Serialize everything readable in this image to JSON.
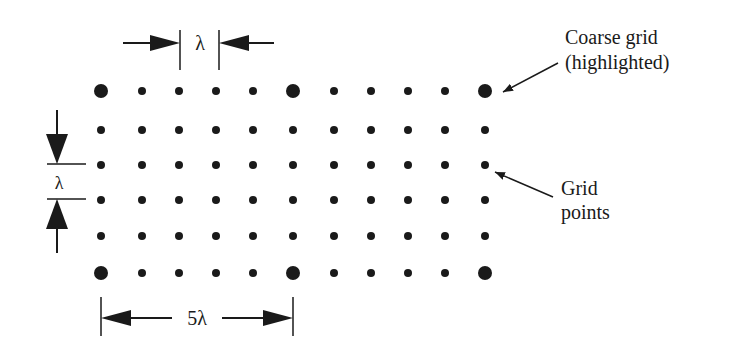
{
  "diagram": {
    "type": "grid-schematic",
    "colors": {
      "ink": "#1a1a1a",
      "background": "#ffffff"
    },
    "grid": {
      "columns_x": [
        101,
        142,
        179,
        216,
        253,
        293,
        334,
        371,
        408,
        445,
        485
      ],
      "rows_y": [
        91,
        130,
        165,
        200,
        236,
        273
      ],
      "coarse_every": 5,
      "fine_dot_radius": 4,
      "coarse_dot_radius": 7
    },
    "dimensions": {
      "horizontal_spacing": {
        "label": "λ"
      },
      "vertical_spacing": {
        "label": "λ"
      },
      "coarse_spacing": {
        "label": "5λ"
      }
    },
    "annotations": {
      "coarse_grid": {
        "line1": "Coarse grid",
        "line2": "(highlighted)"
      },
      "grid_points": {
        "line1": "Grid",
        "line2": "points"
      }
    }
  }
}
